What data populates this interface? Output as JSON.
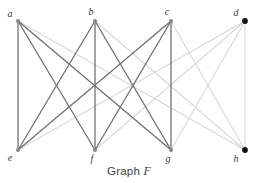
{
  "caption": {
    "prefix": "Graph",
    "name": "F"
  },
  "colors": {
    "dark_edge": "#707070",
    "light_edge": "#d8d8d8",
    "node_gray": "#8a8a8a",
    "node_black": "#111111",
    "label": "#3a3a3a",
    "background": "#ffffff"
  },
  "chart_data": {
    "type": "diagram",
    "title": "Graph F",
    "subtype": "node-link-graph",
    "node_count": 8,
    "edge_count": 18,
    "nodes": [
      {
        "id": "a",
        "label": "a",
        "x": 18,
        "y": 21,
        "style": "gray",
        "label_dx": -8,
        "label_dy": -4
      },
      {
        "id": "b",
        "label": "b",
        "x": 95,
        "y": 21,
        "style": "gray",
        "label_dx": -4,
        "label_dy": -6
      },
      {
        "id": "c",
        "label": "c",
        "x": 171,
        "y": 21,
        "style": "gray",
        "label_dx": -4,
        "label_dy": -6
      },
      {
        "id": "d",
        "label": "d",
        "x": 245,
        "y": 21,
        "style": "black",
        "label_dx": -9,
        "label_dy": -5
      },
      {
        "id": "e",
        "label": "e",
        "x": 18,
        "y": 150,
        "style": "gray",
        "label_dx": -8,
        "label_dy": 11
      },
      {
        "id": "f",
        "label": "f",
        "x": 95,
        "y": 150,
        "style": "gray",
        "label_dx": -3,
        "label_dy": 12
      },
      {
        "id": "g",
        "label": "g",
        "x": 171,
        "y": 150,
        "style": "gray",
        "label_dx": -3,
        "label_dy": 12
      },
      {
        "id": "h",
        "label": "h",
        "x": 245,
        "y": 150,
        "style": "black",
        "label_dx": -9,
        "label_dy": 12
      }
    ],
    "edges": [
      {
        "from": "a",
        "to": "e",
        "tone": "dark"
      },
      {
        "from": "a",
        "to": "f",
        "tone": "dark"
      },
      {
        "from": "a",
        "to": "g",
        "tone": "dark"
      },
      {
        "from": "a",
        "to": "h",
        "tone": "light"
      },
      {
        "from": "b",
        "to": "e",
        "tone": "dark"
      },
      {
        "from": "b",
        "to": "f",
        "tone": "dark"
      },
      {
        "from": "b",
        "to": "g",
        "tone": "dark"
      },
      {
        "from": "b",
        "to": "h",
        "tone": "light"
      },
      {
        "from": "c",
        "to": "e",
        "tone": "dark"
      },
      {
        "from": "c",
        "to": "f",
        "tone": "dark"
      },
      {
        "from": "c",
        "to": "g",
        "tone": "dark"
      },
      {
        "from": "c",
        "to": "h",
        "tone": "light"
      },
      {
        "from": "d",
        "to": "e",
        "tone": "light"
      },
      {
        "from": "d",
        "to": "f",
        "tone": "light"
      },
      {
        "from": "d",
        "to": "g",
        "tone": "light"
      },
      {
        "from": "d",
        "to": "h",
        "tone": "light"
      },
      {
        "from": "c",
        "to": "g",
        "tone": "dark",
        "duplicate": false
      },
      {
        "from": "a",
        "to": "e",
        "tone": "dark",
        "duplicate": false
      }
    ]
  }
}
